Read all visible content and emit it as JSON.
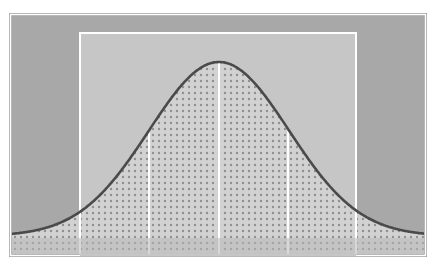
{
  "diagram": {
    "type": "normal-distribution",
    "canvas": {
      "width": 437,
      "height": 264
    },
    "frame": {
      "x": 10,
      "y": 14,
      "width": 416,
      "height": 242,
      "outer_border_color": "#9a9a9a",
      "inner_border_color": "#ffffff",
      "fill_color": "#a8a8a8"
    },
    "center_band": {
      "x": 80,
      "y": 33,
      "width": 276,
      "height": 223,
      "border_color": "#ffffff",
      "fill_color": "#c6c6c6"
    },
    "sigma_lines": {
      "color": "#ffffff",
      "positions_x": [
        149,
        219,
        288
      ],
      "labels": [
        "-1σ",
        "mean",
        "+1σ"
      ]
    },
    "curve": {
      "mean_x": 219,
      "sigma_px": 70,
      "peak_y": 64,
      "baseline_y": 238,
      "x_start": 12,
      "x_end": 424,
      "stroke_color": "#4a4a4a",
      "stroke_width": 2.6
    },
    "fill_pattern": {
      "type": "dots",
      "dot_color": "#8f8f8f",
      "spacing": 6,
      "dot_radius": 1.2,
      "base_color": "#d2d2d2"
    },
    "bottom_strip": {
      "y": 238,
      "height": 18,
      "colors": [
        "#a2a2a2",
        "#c4c4c4",
        "#c4c4c4",
        "#c4c4c4",
        "#c4c4c4",
        "#a2a2a2"
      ]
    }
  }
}
